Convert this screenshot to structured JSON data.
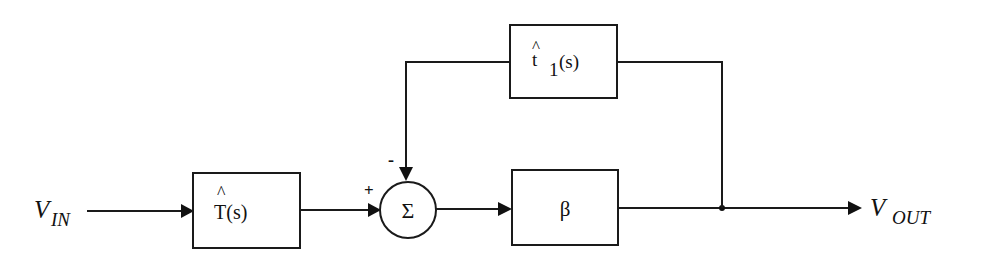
{
  "colors": {
    "line": "#1a1a1a",
    "text": "#111111",
    "background": "#ffffff"
  },
  "input": {
    "label_main": "V",
    "label_sub": "IN"
  },
  "output": {
    "label_main": "V",
    "label_sub": "OUT"
  },
  "blocks": {
    "forward_filter": {
      "hat": "^",
      "label": "T(s)"
    },
    "summing_junction": {
      "symbol": "Σ",
      "plus_sign": "+",
      "minus_sign": "-"
    },
    "gain": {
      "label": "β"
    },
    "feedback": {
      "hat": "^",
      "label_main": "t",
      "label_sub": "1",
      "label_arg": "(s)"
    }
  }
}
